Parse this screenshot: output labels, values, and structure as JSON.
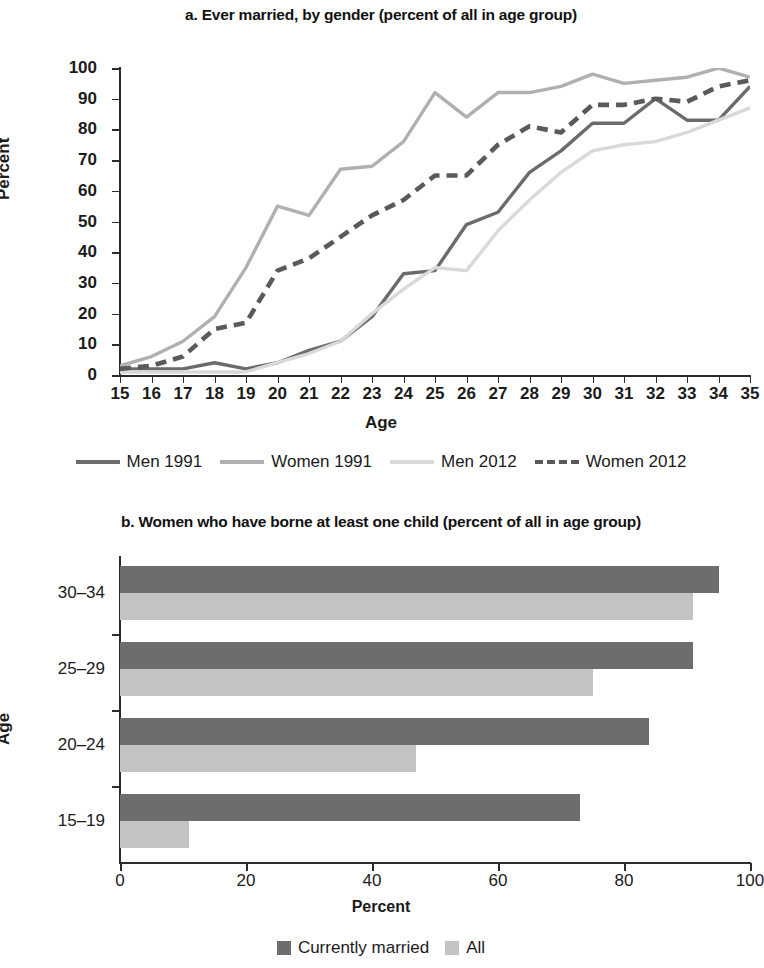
{
  "figure": {
    "panel_a_title": "a. Ever married, by gender (percent of all in age group)",
    "panel_b_title": "b. Women who have borne at least one child (percent of all in age group)"
  },
  "colors": {
    "men_1991": "#6b6b6b",
    "women_1991": "#b0b0b0",
    "men_2012": "#d9d9d9",
    "women_2012": "#5a5a5a",
    "bar_currently_married": "#6d6d6d",
    "bar_all": "#c3c3c3",
    "axis": "#2b2b2b"
  },
  "chart_data": [
    {
      "type": "line",
      "title": "a. Ever married, by gender (percent of all in age group)",
      "xlabel": "Age",
      "ylabel": "Percent",
      "xlim": [
        15,
        35
      ],
      "ylim": [
        0,
        100
      ],
      "grid": false,
      "legend_position": "bottom",
      "x": [
        15,
        16,
        17,
        18,
        19,
        20,
        21,
        22,
        23,
        24,
        25,
        26,
        27,
        28,
        29,
        30,
        31,
        32,
        33,
        34,
        35
      ],
      "xticks": [
        "15",
        "16",
        "17",
        "18",
        "19",
        "20",
        "21",
        "22",
        "23",
        "24",
        "25",
        "26",
        "27",
        "28",
        "29",
        "30",
        "31",
        "32",
        "33",
        "34",
        "35"
      ],
      "yticks": [
        "0",
        "10",
        "20",
        "30",
        "40",
        "50",
        "60",
        "70",
        "80",
        "90",
        "100"
      ],
      "series": [
        {
          "name": "Men 1991",
          "style": "solid",
          "color": "#6b6b6b",
          "values": [
            2,
            2,
            2,
            4,
            2,
            4,
            8,
            11,
            19,
            33,
            34,
            49,
            53,
            66,
            73,
            82,
            82,
            90,
            83,
            83,
            94
          ]
        },
        {
          "name": "Women 1991",
          "style": "solid",
          "color": "#b0b0b0",
          "values": [
            3,
            6,
            11,
            19,
            35,
            55,
            52,
            67,
            68,
            76,
            92,
            84,
            92,
            92,
            94,
            98,
            95,
            96,
            97,
            100,
            97
          ]
        },
        {
          "name": "Men 2012",
          "style": "solid",
          "color": "#d9d9d9",
          "values": [
            1,
            1,
            1,
            1,
            1,
            4,
            7,
            11,
            20,
            28,
            35,
            34,
            47,
            57,
            66,
            73,
            75,
            76,
            79,
            83,
            87
          ]
        },
        {
          "name": "Women 2012",
          "style": "dashed",
          "color": "#5a5a5a",
          "values": [
            2,
            3,
            6,
            15,
            17,
            34,
            38,
            45,
            52,
            57,
            65,
            65,
            75,
            81,
            79,
            88,
            88,
            90,
            89,
            94,
            96
          ]
        }
      ],
      "legend": [
        "Men 1991",
        "Women 1991",
        "Men 2012",
        "Women 2012"
      ]
    },
    {
      "type": "bar",
      "orientation": "horizontal",
      "title": "b. Women who have borne at least one child (percent of all in age group)",
      "xlabel": "Percent",
      "ylabel": "Age",
      "xlim": [
        0,
        100
      ],
      "grid": false,
      "legend_position": "bottom",
      "categories": [
        "30–34",
        "25–29",
        "20–24",
        "15–19"
      ],
      "xticks": [
        "0",
        "20",
        "40",
        "60",
        "80",
        "100"
      ],
      "series": [
        {
          "name": "Currently married",
          "color": "#6d6d6d",
          "values": [
            95,
            91,
            84,
            73
          ]
        },
        {
          "name": "All",
          "color": "#c3c3c3",
          "values": [
            91,
            75,
            47,
            11
          ]
        }
      ],
      "legend": [
        "Currently married",
        "All"
      ]
    }
  ]
}
